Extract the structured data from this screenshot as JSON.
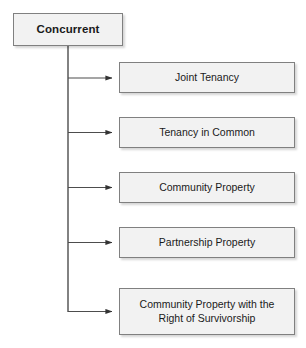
{
  "diagram": {
    "type": "hierarchy-tree",
    "title": "Concurrent",
    "root": {
      "label": "Concurrent",
      "bold": true
    },
    "children": [
      {
        "label": "Joint Tenancy"
      },
      {
        "label": "Tenancy in Common"
      },
      {
        "label": "Community Property"
      },
      {
        "label": "Partnership Property"
      },
      {
        "label": "Community Property with the\nRight of Survivorship"
      }
    ],
    "colors": {
      "node_fill": "#f2f2f2",
      "node_border": "#808080",
      "connector": "#4d4d4d",
      "text": "#1a1a1a",
      "background": "#ffffff"
    }
  }
}
